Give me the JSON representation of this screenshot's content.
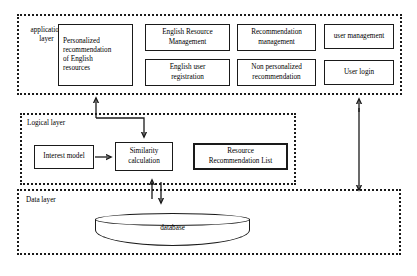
{
  "figure": {
    "caption": "",
    "layers": [
      {
        "id": "application",
        "label": "application\nlayer",
        "nodes": [
          {
            "id": "personalized",
            "label": "Personalized\nrecommendation\nof English\nresources"
          },
          {
            "id": "eng-res-mgmt",
            "label": "English Resource\nManagement"
          },
          {
            "id": "rec-mgmt",
            "label": "Recommendation\nmanagement"
          },
          {
            "id": "user-mgmt",
            "label": "user management"
          },
          {
            "id": "eng-user-reg",
            "label": "English user\nregistration"
          },
          {
            "id": "non-personal",
            "label": "Non personalized\nrecommendation"
          },
          {
            "id": "user-login",
            "label": "User login"
          }
        ]
      },
      {
        "id": "logical",
        "label": "Logical layer",
        "nodes": [
          {
            "id": "interest-model",
            "label": "Interest model"
          },
          {
            "id": "similarity",
            "label": "Similarity\ncalculation"
          },
          {
            "id": "resource-list",
            "label": "Resource\nRecommendation List"
          }
        ]
      },
      {
        "id": "data",
        "label": "Data layer",
        "nodes": [
          {
            "id": "database",
            "label": "database"
          }
        ]
      }
    ],
    "colors": {
      "stroke": "#1a1a1a",
      "background": "#ffffff"
    }
  }
}
